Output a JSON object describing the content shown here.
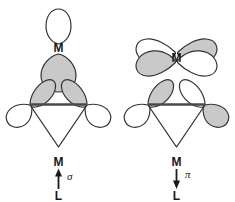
{
  "figure": {
    "title": "",
    "background_color": "#ffffff",
    "width": 235,
    "height": 202,
    "stroke_color": "#333333",
    "lobe_fill_shaded": "#c9c9c9",
    "lobe_fill_empty": "#ffffff",
    "label_color": "#1a1a1a"
  },
  "panels": [
    {
      "id": "sigma-donation",
      "name": "sigma donation",
      "metal_label": "M",
      "ligand_label": "L",
      "interaction_symbol": "σ",
      "arrow_direction": "up",
      "arrow_meaning": "L to M",
      "metal_orbital": {
        "type": "sp-hybrid",
        "lobes": [
          {
            "name": "upper-lobe",
            "shaded": false
          },
          {
            "name": "lower-lobe",
            "shaded": true
          }
        ]
      },
      "ligand_orbital": {
        "type": "pi",
        "lobes": [
          {
            "name": "left-inner-lobe",
            "shaded": true
          },
          {
            "name": "right-inner-lobe",
            "shaded": true
          },
          {
            "name": "left-outer-lobe",
            "shaded": false
          },
          {
            "name": "right-outer-lobe",
            "shaded": false
          }
        ]
      },
      "ligand_skeleton": "triangle with horizontal bond"
    },
    {
      "id": "pi-backdonation",
      "name": "pi back-donation",
      "metal_label": "M",
      "ligand_label": "L",
      "interaction_symbol": "π",
      "arrow_direction": "down",
      "arrow_meaning": "M to L",
      "metal_orbital": {
        "type": "d",
        "lobes": [
          {
            "name": "upper-left-lobe",
            "shaded": false
          },
          {
            "name": "upper-right-lobe",
            "shaded": true
          },
          {
            "name": "lower-left-lobe",
            "shaded": true
          },
          {
            "name": "lower-right-lobe",
            "shaded": false
          }
        ]
      },
      "ligand_orbital": {
        "type": "pi-star",
        "lobes": [
          {
            "name": "left-inner-lobe",
            "shaded": true
          },
          {
            "name": "right-inner-lobe",
            "shaded": false
          },
          {
            "name": "left-outer-lobe",
            "shaded": false
          },
          {
            "name": "right-outer-lobe",
            "shaded": true
          }
        ]
      },
      "ligand_skeleton": "triangle with horizontal bond"
    }
  ]
}
